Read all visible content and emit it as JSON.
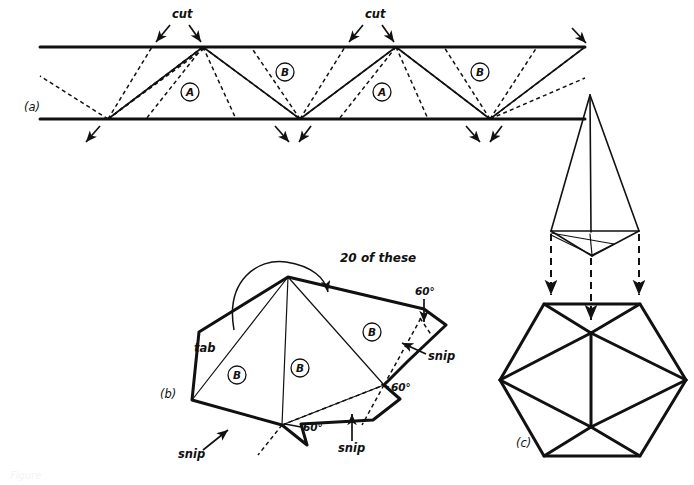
{
  "figure": {
    "background_color": "#ffffff",
    "ink_color": "#111111",
    "panels": [
      {
        "id": "a",
        "label": "(a)",
        "x": 24,
        "y": 108
      },
      {
        "id": "b",
        "label": "(b)",
        "x": 163,
        "y": 395
      },
      {
        "id": "c",
        "label": "(c)",
        "x": 519,
        "y": 443
      }
    ]
  },
  "panel_a": {
    "label": "(a)",
    "strip": {
      "top_y": 47,
      "bottom_y": 119,
      "left_x": 40,
      "right_x": 585
    },
    "cut_labels": [
      {
        "text": "cut",
        "x": 187,
        "y": 18
      },
      {
        "text": "cut",
        "x": 380,
        "y": 18
      }
    ],
    "face_labels": [
      {
        "text": "A",
        "x": 190,
        "y": 92
      },
      {
        "text": "B",
        "x": 285,
        "y": 72
      },
      {
        "text": "A",
        "x": 382,
        "y": 92
      },
      {
        "text": "B",
        "x": 480,
        "y": 72
      }
    ]
  },
  "panel_b": {
    "label": "(b)",
    "note": "20 of these",
    "note_pos": {
      "x": 358,
      "y": 258
    },
    "tab_label": "tab",
    "tab_pos": {
      "x": 203,
      "y": 348
    },
    "face_labels": [
      {
        "text": "B",
        "x": 237,
        "y": 375
      },
      {
        "text": "B",
        "x": 298,
        "y": 368
      },
      {
        "text": "B",
        "x": 372,
        "y": 332
      }
    ],
    "angle_labels": [
      {
        "text": "60°",
        "x": 423,
        "y": 298
      },
      {
        "text": "60°",
        "x": 390,
        "y": 395
      },
      {
        "text": "60°",
        "x": 312,
        "y": 428
      }
    ],
    "snip_labels": [
      {
        "text": "snip",
        "x": 432,
        "y": 356
      },
      {
        "text": "snip",
        "x": 352,
        "y": 447
      },
      {
        "text": "snip",
        "x": 193,
        "y": 452
      }
    ]
  },
  "panel_c": {
    "label": "(c)",
    "upper_shape": "pentagonal-pyramid-cap",
    "lower_shape": "icosahedron-outline"
  },
  "caption": {
    "text": "Figure",
    "x": 10,
    "y": 478
  }
}
